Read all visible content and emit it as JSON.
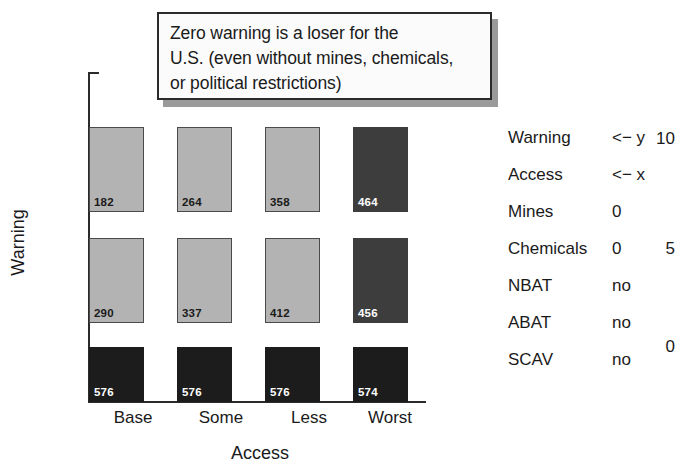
{
  "annotation": {
    "name": "zero-warning-callout",
    "lines": [
      "Zero warning is a loser for the",
      "U.S. (even without mines, chemicals,",
      "or political restrictions)"
    ]
  },
  "chart_data": {
    "type": "bar",
    "title": "",
    "xlabel": "Access",
    "ylabel": "Warning",
    "categories": [
      "Base",
      "Some",
      "Less",
      "Worst"
    ],
    "yticks": [
      "10",
      "5",
      "0"
    ],
    "ylim": [
      0,
      12
    ],
    "grid": false,
    "legend_position": "right",
    "series": [
      {
        "name": "10",
        "warning_level": 10,
        "values": [
          182,
          264,
          358,
          464
        ]
      },
      {
        "name": "5",
        "warning_level": 5,
        "values": [
          290,
          337,
          412,
          456
        ]
      },
      {
        "name": "0",
        "warning_level": 0,
        "values": [
          576,
          576,
          576,
          574
        ]
      }
    ],
    "bar_styles": [
      [
        "light",
        "light",
        "light",
        "dark"
      ],
      [
        "light",
        "light",
        "light",
        "dark"
      ],
      [
        "black",
        "black",
        "black",
        "black"
      ]
    ],
    "colors": {
      "light": "#b3b3b3",
      "dark": "#3d3d3d",
      "black": "#1c1c1c",
      "axis": "#2b2b2b"
    }
  },
  "legend": {
    "rows": [
      {
        "label": "Warning",
        "value": "<− y"
      },
      {
        "label": "Access",
        "value": "<− x"
      },
      {
        "label": "Mines",
        "value": "0"
      },
      {
        "label": "Chemicals",
        "value": "0"
      },
      {
        "label": "NBAT",
        "value": "no"
      },
      {
        "label": "ABAT",
        "value": "no"
      },
      {
        "label": "SCAV",
        "value": "no"
      }
    ]
  }
}
